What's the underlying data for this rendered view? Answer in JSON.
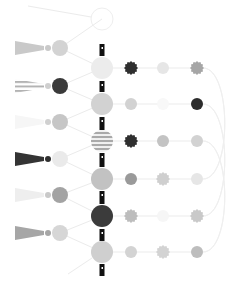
{
  "diagram": {
    "width": 244,
    "height": 295,
    "background": "#ffffff",
    "edge_color": "#ebebeb",
    "spine": {
      "x": 102,
      "color": "#111111",
      "segments": [
        {
          "y1": 44,
          "y2": 56
        },
        {
          "y1": 81,
          "y2": 92
        },
        {
          "y1": 117,
          "y2": 130
        },
        {
          "y1": 153,
          "y2": 167
        },
        {
          "y1": 191,
          "y2": 204
        },
        {
          "y1": 229,
          "y2": 241
        },
        {
          "y1": 264,
          "y2": 276
        }
      ]
    },
    "center_nodes": [
      {
        "id": "c0",
        "x": 102,
        "y": 19,
        "r": 11,
        "fill": "none",
        "stroke": "#eeeeee",
        "style": "outline"
      },
      {
        "id": "c1",
        "x": 102,
        "y": 68,
        "r": 11,
        "fill": "#ececec",
        "style": "solid"
      },
      {
        "id": "c2",
        "x": 102,
        "y": 104,
        "r": 11,
        "fill": "#d2d2d2",
        "style": "solid"
      },
      {
        "id": "c3",
        "x": 102,
        "y": 141,
        "r": 11,
        "fill": "#a9a9a9",
        "style": "striped"
      },
      {
        "id": "c4",
        "x": 102,
        "y": 179,
        "r": 11,
        "fill": "#c2c2c2",
        "style": "solid"
      },
      {
        "id": "c5",
        "x": 102,
        "y": 216,
        "r": 11,
        "fill": "#3b3b3b",
        "style": "solid"
      },
      {
        "id": "c6",
        "x": 102,
        "y": 252,
        "r": 11,
        "fill": "#cfcfcf",
        "style": "solid"
      }
    ],
    "left_nodes": [
      {
        "id": "l1",
        "x": 60,
        "y": 48,
        "r": 8,
        "fill": "#d3d3d3"
      },
      {
        "id": "l2",
        "x": 60,
        "y": 86,
        "r": 8,
        "fill": "#3a3a3a"
      },
      {
        "id": "l3",
        "x": 60,
        "y": 122,
        "r": 8,
        "fill": "#c6c6c6"
      },
      {
        "id": "l4",
        "x": 60,
        "y": 159,
        "r": 8,
        "fill": "#eaeaea"
      },
      {
        "id": "l5",
        "x": 60,
        "y": 195,
        "r": 8,
        "fill": "#a3a3a3"
      },
      {
        "id": "l6",
        "x": 60,
        "y": 233,
        "r": 8,
        "fill": "#d6d6d6"
      }
    ],
    "tassels": [
      {
        "id": "t1",
        "y": 48,
        "fill": "#c9c9c9",
        "style": "solid",
        "knob": "#c9c9c9"
      },
      {
        "id": "t2",
        "y": 86,
        "fill": "#b3b3b3",
        "style": "striped",
        "knob": "#cfcfcf"
      },
      {
        "id": "t3",
        "y": 122,
        "fill": "#f6f6f6",
        "style": "solid",
        "knob": "#d0d0d0"
      },
      {
        "id": "t4",
        "y": 159,
        "fill": "#343434",
        "style": "solid",
        "knob": "#2f2f2f"
      },
      {
        "id": "t5",
        "y": 195,
        "fill": "#eeeeee",
        "style": "solid",
        "knob": "#c9c9c9"
      },
      {
        "id": "t6",
        "y": 233,
        "fill": "#a6a6a6",
        "style": "solid",
        "knob": "#a6a6a6"
      }
    ],
    "right_rows": [
      {
        "y": 68,
        "nodes": [
          {
            "x": 131,
            "fill": "#2f2f2f",
            "shape": "gear"
          },
          {
            "x": 163,
            "fill": "#e6e6e6",
            "shape": "circle"
          },
          {
            "x": 197,
            "fill": "#a6a6a6",
            "shape": "gear"
          }
        ]
      },
      {
        "y": 104,
        "nodes": [
          {
            "x": 131,
            "fill": "#d2d2d2",
            "shape": "circle"
          },
          {
            "x": 163,
            "fill": "#f8f8f8",
            "shape": "circle"
          },
          {
            "x": 197,
            "fill": "#2c2c2c",
            "shape": "circle"
          }
        ]
      },
      {
        "y": 141,
        "nodes": [
          {
            "x": 131,
            "fill": "#2f2f2f",
            "shape": "gear"
          },
          {
            "x": 163,
            "fill": "#c3c3c3",
            "shape": "circle"
          },
          {
            "x": 197,
            "fill": "#d2d2d2",
            "shape": "circle"
          }
        ]
      },
      {
        "y": 179,
        "nodes": [
          {
            "x": 131,
            "fill": "#9a9a9a",
            "shape": "circle"
          },
          {
            "x": 163,
            "fill": "#cfcfcf",
            "shape": "gear"
          },
          {
            "x": 197,
            "fill": "#e6e6e6",
            "shape": "circle"
          }
        ]
      },
      {
        "y": 216,
        "nodes": [
          {
            "x": 131,
            "fill": "#bdbdbd",
            "shape": "gear"
          },
          {
            "x": 163,
            "fill": "#f6f6f6",
            "shape": "circle"
          },
          {
            "x": 197,
            "fill": "#c9c9c9",
            "shape": "gear"
          }
        ]
      },
      {
        "y": 252,
        "nodes": [
          {
            "x": 131,
            "fill": "#d3d3d3",
            "shape": "circle"
          },
          {
            "x": 163,
            "fill": "#d3d3d3",
            "shape": "gear"
          },
          {
            "x": 197,
            "fill": "#bdbdbd",
            "shape": "circle"
          }
        ]
      }
    ],
    "right_node_radius": 6
  }
}
